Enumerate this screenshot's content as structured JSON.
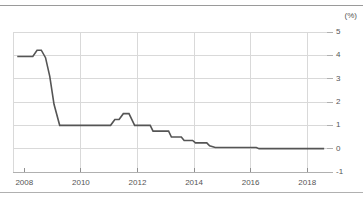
{
  "chart_data": {
    "type": "line",
    "title": "",
    "subtitle": "",
    "xlabel": "",
    "ylabel": "",
    "unit_label": "(%)",
    "xlim": [
      2007.6,
      2018.7
    ],
    "ylim": [
      -1,
      5
    ],
    "grid": true,
    "legend": "none",
    "series_color": "#555555",
    "grid_color": "#d9d9d9",
    "axis_color": "#b0b0b0",
    "xticks": [
      2008,
      2010,
      2012,
      2014,
      2016,
      2018
    ],
    "xtick_labels": [
      "2008",
      "2010",
      "2012",
      "2014",
      "2016",
      "2018"
    ],
    "yticks": [
      -1,
      0,
      1,
      2,
      3,
      4,
      5
    ],
    "ytick_labels": [
      "-1",
      "0",
      "1",
      "2",
      "3",
      "4",
      "5"
    ],
    "series": [
      {
        "name": "Policy interest rate",
        "x": [
          2007.75,
          2008.3,
          2008.45,
          2008.6,
          2008.75,
          2008.9,
          2009.05,
          2009.25,
          2009.4,
          2011.05,
          2011.2,
          2011.35,
          2011.5,
          2011.7,
          2011.9,
          2012.0,
          2012.45,
          2012.55,
          2013.1,
          2013.2,
          2013.55,
          2013.65,
          2013.95,
          2014.05,
          2014.45,
          2014.55,
          2014.75,
          2016.2,
          2016.3,
          2018.6
        ],
        "y": [
          3.95,
          3.95,
          4.22,
          4.22,
          3.9,
          3.1,
          1.9,
          1.0,
          1.0,
          1.0,
          1.25,
          1.25,
          1.5,
          1.5,
          1.0,
          1.0,
          1.0,
          0.75,
          0.75,
          0.5,
          0.5,
          0.35,
          0.35,
          0.25,
          0.25,
          0.12,
          0.05,
          0.05,
          0.0,
          0.0
        ]
      }
    ]
  },
  "axes": {
    "unit": "(%)"
  }
}
